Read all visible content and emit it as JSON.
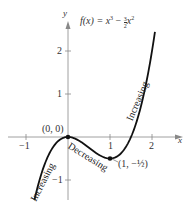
{
  "chart_data": {
    "type": "line",
    "xlabel": "x",
    "ylabel": "y",
    "xlim": [
      -1.5,
      2.6
    ],
    "ylim": [
      -1.6,
      2.7
    ],
    "x_ticks": [
      -1,
      1,
      2
    ],
    "y_ticks": [
      2,
      1,
      -1
    ],
    "series": [
      {
        "name": "f(x) = x^3 - (3/2)x^2",
        "x": [
          -0.8,
          -0.6,
          -0.4,
          -0.2,
          0,
          0.2,
          0.4,
          0.6,
          0.8,
          1.0,
          1.2,
          1.4,
          1.6,
          1.8,
          2.0,
          2.07
        ],
        "y": [
          -1.472,
          -0.756,
          -0.304,
          -0.068,
          0,
          -0.052,
          -0.176,
          -0.324,
          -0.448,
          -0.5,
          -0.432,
          -0.196,
          0.256,
          0.972,
          2.0,
          2.44
        ]
      }
    ],
    "points": [
      {
        "label": "(0, 0)",
        "x": 0,
        "y": 0
      },
      {
        "label": "(1, -1/2)",
        "x": 1,
        "y": -0.5
      }
    ],
    "annotations": [
      "Increasing",
      "Decreasing",
      "Increasing"
    ],
    "grid": false
  },
  "labels": {
    "title_fx": "f(x) = x",
    "title_exp3": "3",
    "title_minus": " − ",
    "title_frac_num": "3",
    "title_frac_den": "2",
    "title_x2": "x",
    "title_exp2": "2",
    "axis_x": "x",
    "axis_y": "y",
    "tick_xm1": "−1",
    "tick_x1": "1",
    "tick_x2": "2",
    "tick_y2": "2",
    "tick_y1": "1",
    "tick_ym1": "−1",
    "point_origin": "(0, 0)",
    "point_min": "(1, −½)",
    "ann_left": "Increasing",
    "ann_mid": "Decreasing",
    "ann_right": "Increasing"
  }
}
